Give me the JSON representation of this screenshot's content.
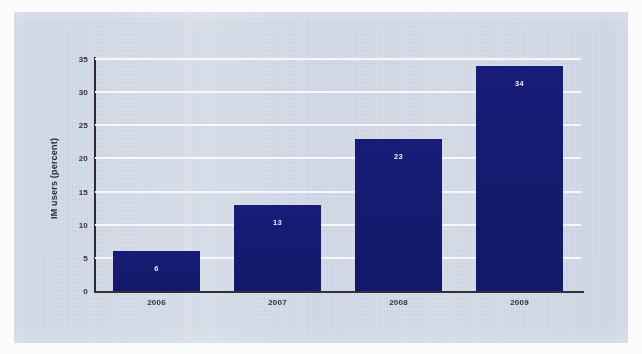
{
  "chart_data": {
    "type": "bar",
    "title": "",
    "subtitle": "",
    "xlabel": "",
    "ylabel": "IM users (percent)",
    "categories": [
      "2006",
      "2007",
      "2008",
      "2009"
    ],
    "values": [
      6,
      13,
      23,
      34
    ],
    "data_labels": [
      "6",
      "13",
      "23",
      "34"
    ],
    "series": [
      {
        "name": "IM users (percent)",
        "values": [
          6,
          13,
          23,
          34
        ]
      }
    ],
    "ylim": [
      0,
      35
    ],
    "ytick_labels": [
      "0",
      "5",
      "10",
      "15",
      "20",
      "25",
      "30",
      "35"
    ],
    "ytick_values": [
      0,
      5,
      10,
      15,
      20,
      25,
      30,
      35
    ],
    "grid": "horizontal",
    "gridline_color": "#f7f8fb",
    "legend": "none",
    "bar_color": "#141a6b",
    "data_label_color": "#e6e8f4",
    "axis_color": "#2f2f36",
    "background_color": "#ced5e3",
    "page_background_color": "#fbfbfc"
  }
}
